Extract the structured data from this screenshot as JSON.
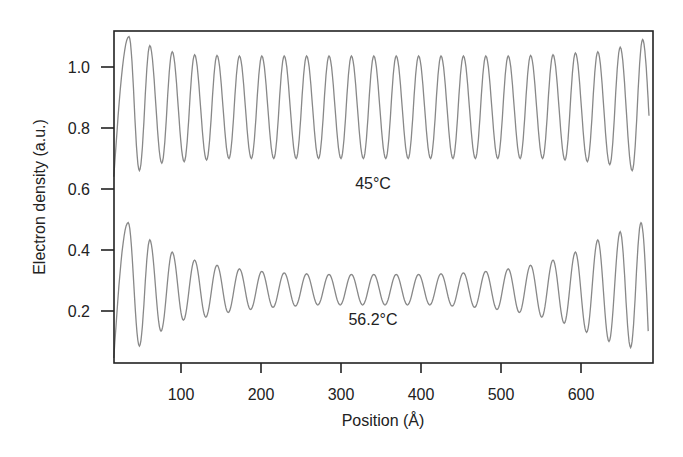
{
  "chart_data": {
    "type": "line",
    "title": "",
    "xlabel": "Position (Å)",
    "ylabel": "Electron density (a.u.)",
    "xlim": [
      16,
      690
    ],
    "ylim": [
      0.03,
      1.118
    ],
    "grid": false,
    "legend": null,
    "x_ticks": [
      100,
      200,
      300,
      400,
      500,
      600
    ],
    "x_tick_labels": [
      "100",
      "200",
      "300",
      "400",
      "500",
      "600"
    ],
    "y_ticks": [
      0.2,
      0.4,
      0.6,
      0.8,
      1.0
    ],
    "y_tick_labels": [
      "0.2",
      "0.4",
      "0.6",
      "0.8",
      "1.0"
    ],
    "annotations": [
      {
        "text": "45°C",
        "x": 340,
        "y": 0.6
      },
      {
        "text": "56.2°C",
        "x": 340,
        "y": 0.17
      }
    ],
    "series": [
      {
        "name": "45°C",
        "color": "#888888",
        "period": 27.95,
        "x_start": 16,
        "x_end": 685,
        "y_start": 0.64,
        "y_end": 0.84,
        "peaks": [
          [
            35,
            1.1
          ],
          [
            61,
            1.07
          ],
          [
            89,
            1.05
          ],
          [
            117,
            1.04
          ],
          [
            145,
            1.038
          ],
          [
            173,
            1.036
          ],
          [
            201,
            1.036
          ],
          [
            229,
            1.036
          ],
          [
            257,
            1.036
          ],
          [
            285,
            1.036
          ],
          [
            313,
            1.036
          ],
          [
            341,
            1.036
          ],
          [
            369,
            1.036
          ],
          [
            397,
            1.036
          ],
          [
            425,
            1.036
          ],
          [
            453,
            1.036
          ],
          [
            481,
            1.036
          ],
          [
            509,
            1.036
          ],
          [
            537,
            1.038
          ],
          [
            565,
            1.04
          ],
          [
            593,
            1.046
          ],
          [
            621,
            1.05
          ],
          [
            649,
            1.065
          ],
          [
            677,
            1.09
          ]
        ],
        "troughs": [
          [
            48,
            0.66
          ],
          [
            76,
            0.685
          ],
          [
            104,
            0.69
          ],
          [
            132,
            0.695
          ],
          [
            160,
            0.7
          ],
          [
            188,
            0.7
          ],
          [
            216,
            0.7
          ],
          [
            244,
            0.7
          ],
          [
            272,
            0.7
          ],
          [
            300,
            0.7
          ],
          [
            328,
            0.7
          ],
          [
            356,
            0.7
          ],
          [
            384,
            0.7
          ],
          [
            412,
            0.7
          ],
          [
            440,
            0.7
          ],
          [
            468,
            0.7
          ],
          [
            496,
            0.7
          ],
          [
            524,
            0.7
          ],
          [
            552,
            0.7
          ],
          [
            580,
            0.695
          ],
          [
            608,
            0.69
          ],
          [
            636,
            0.68
          ],
          [
            664,
            0.66
          ]
        ]
      },
      {
        "name": "56.2°C",
        "color": "#888888",
        "period": 27.95,
        "x_start": 16,
        "x_end": 684,
        "y_start": 0.046,
        "y_end": 0.134,
        "peaks": [
          [
            34,
            0.49
          ],
          [
            61,
            0.433
          ],
          [
            89,
            0.393
          ],
          [
            117,
            0.367
          ],
          [
            145,
            0.35
          ],
          [
            173,
            0.338
          ],
          [
            201,
            0.33
          ],
          [
            229,
            0.325
          ],
          [
            257,
            0.322
          ],
          [
            285,
            0.32
          ],
          [
            313,
            0.32
          ],
          [
            341,
            0.32
          ],
          [
            369,
            0.32
          ],
          [
            397,
            0.32
          ],
          [
            425,
            0.322
          ],
          [
            453,
            0.325
          ],
          [
            481,
            0.33
          ],
          [
            509,
            0.338
          ],
          [
            537,
            0.35
          ],
          [
            565,
            0.367
          ],
          [
            593,
            0.393
          ],
          [
            621,
            0.433
          ],
          [
            649,
            0.46
          ],
          [
            675,
            0.49
          ]
        ],
        "troughs": [
          [
            48,
            0.085
          ],
          [
            75,
            0.134
          ],
          [
            103,
            0.17
          ],
          [
            131,
            0.18
          ],
          [
            159,
            0.195
          ],
          [
            187,
            0.205
          ],
          [
            215,
            0.212
          ],
          [
            243,
            0.216
          ],
          [
            271,
            0.22
          ],
          [
            299,
            0.22
          ],
          [
            327,
            0.22
          ],
          [
            355,
            0.22
          ],
          [
            383,
            0.22
          ],
          [
            411,
            0.22
          ],
          [
            439,
            0.216
          ],
          [
            467,
            0.212
          ],
          [
            495,
            0.205
          ],
          [
            523,
            0.195
          ],
          [
            551,
            0.18
          ],
          [
            579,
            0.16
          ],
          [
            607,
            0.13
          ],
          [
            635,
            0.1
          ],
          [
            662,
            0.08
          ]
        ]
      }
    ]
  }
}
